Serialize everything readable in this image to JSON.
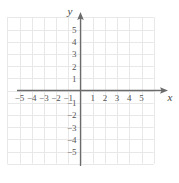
{
  "figure": {
    "kind": "cartesian-coordinate-plane",
    "background_color": "#ffffff",
    "grid_color": "#e8e8e8",
    "axis_color": "#6b6b6b",
    "label_color": "#555555",
    "axis_label_color": "#444444"
  },
  "axes": {
    "x_axis_label": "x",
    "y_axis_label": "y",
    "x_range": [
      -6,
      6
    ],
    "y_range": [
      -6,
      6
    ],
    "x_tick_labels": [
      "-5",
      "-4",
      "-3",
      "-2",
      "-1",
      "1",
      "2",
      "3",
      "4",
      "5"
    ],
    "y_tick_labels": [
      "5",
      "4",
      "3",
      "2",
      "1",
      "-1",
      "-2",
      "-3",
      "-4",
      "-5"
    ],
    "origin_label": "",
    "grid": "on",
    "arrowheads": [
      "x-positive",
      "y-positive"
    ]
  },
  "chart_data": {
    "type": "scatter",
    "title": "",
    "subtitle": "",
    "xlabel": "x",
    "ylabel": "y",
    "xlim": [
      -6,
      6
    ],
    "ylim": [
      -6,
      6
    ],
    "x_ticks": [
      -5,
      -4,
      -3,
      -2,
      -1,
      1,
      2,
      3,
      4,
      5
    ],
    "y_ticks": [
      -5,
      -4,
      -3,
      -2,
      -1,
      1,
      2,
      3,
      4,
      5
    ],
    "x_tick_labels": [
      "-5",
      "-4",
      "-3",
      "-2",
      "-1",
      "1",
      "2",
      "3",
      "4",
      "5"
    ],
    "y_tick_labels": [
      "-5",
      "-4",
      "-3",
      "-2",
      "-1",
      "1",
      "2",
      "3",
      "4",
      "5"
    ],
    "grid": true,
    "legend": null,
    "annotations": [],
    "series": [
      {
        "name": "empty",
        "x": [],
        "y": [],
        "values": []
      }
    ],
    "note": "Blank grid with no plotted data points, curves, or shading."
  }
}
